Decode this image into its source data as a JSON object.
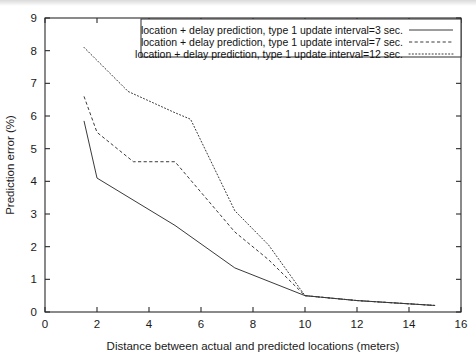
{
  "chart_data": {
    "type": "line",
    "title": "",
    "xlabel": "Distance between actual and predicted locations (meters)",
    "ylabel": "Prediction error (%)",
    "xlim": [
      0,
      16
    ],
    "ylim": [
      0,
      9
    ],
    "xticks": [
      0,
      2,
      4,
      6,
      8,
      10,
      12,
      14,
      16
    ],
    "yticks": [
      0,
      1,
      2,
      3,
      4,
      5,
      6,
      7,
      8,
      9
    ],
    "grid": false,
    "legend_position": "top-right-inside",
    "series": [
      {
        "name": "location + delay prediction, type 1 update interval=3 sec.",
        "style": "solid",
        "x": [
          1.5,
          2.0,
          5.0,
          7.3,
          10.0,
          12.0,
          14.0,
          15.0
        ],
        "y": [
          5.85,
          4.1,
          2.65,
          1.35,
          0.5,
          0.35,
          0.25,
          0.2
        ]
      },
      {
        "name": "location + delay prediction, type 1 update interval=7 sec.",
        "style": "dashed",
        "x": [
          1.5,
          2.0,
          3.4,
          5.0,
          7.3,
          8.6,
          10.0,
          12.0,
          14.0,
          15.0
        ],
        "y": [
          6.6,
          5.5,
          4.6,
          4.6,
          2.45,
          1.6,
          0.5,
          0.35,
          0.25,
          0.2
        ]
      },
      {
        "name": "location + delay prediction, type 1 update interval=12 sec.",
        "style": "dotted",
        "x": [
          1.5,
          3.2,
          5.0,
          5.6,
          7.3,
          8.6,
          10.0,
          12.0,
          14.0,
          15.0
        ],
        "y": [
          8.1,
          6.75,
          6.1,
          5.9,
          3.1,
          2.05,
          0.5,
          0.35,
          0.25,
          0.2
        ]
      }
    ]
  },
  "legend": {
    "entries": [
      {
        "label": "location + delay prediction, type 1 update interval=3 sec.",
        "style": "solid"
      },
      {
        "label": "location + delay prediction, type 1 update interval=7 sec.",
        "style": "dashed"
      },
      {
        "label": "location + delay prediction, type 1 update interval=12 sec.",
        "style": "dotted"
      }
    ]
  }
}
